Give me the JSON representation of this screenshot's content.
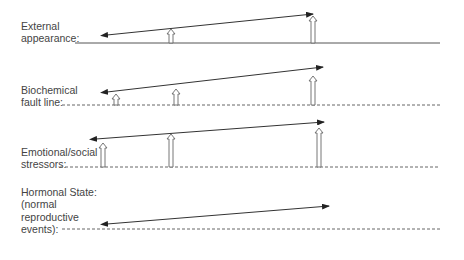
{
  "diagram": {
    "rows": [
      {
        "label_lines": [
          "External",
          "appearance:"
        ],
        "baseline": {
          "style": "solid",
          "y": 43,
          "x1": 75,
          "x2": 440
        },
        "double_arrow": {
          "x1": 107,
          "y1": 35,
          "x2": 313,
          "y2": 14
        },
        "up_arrows": [
          {
            "x": 171,
            "top": 29
          },
          {
            "x": 313,
            "top": 16
          }
        ]
      },
      {
        "label_lines": [
          "Biochemical",
          "fault line:"
        ],
        "baseline": {
          "style": "dashed",
          "y": 105,
          "x1": 62,
          "x2": 440
        },
        "double_arrow": {
          "x1": 107,
          "y1": 92,
          "x2": 323,
          "y2": 67
        },
        "up_arrows": [
          {
            "x": 116,
            "top": 94
          },
          {
            "x": 176,
            "top": 89
          },
          {
            "x": 313,
            "top": 76
          }
        ]
      },
      {
        "label_lines": [
          "Emotional/social",
          "stressors:"
        ],
        "baseline": {
          "style": "dashed",
          "y": 167,
          "x1": 60,
          "x2": 440
        },
        "double_arrow": {
          "x1": 96,
          "y1": 139,
          "x2": 324,
          "y2": 122
        },
        "up_arrows": [
          {
            "x": 103,
            "top": 143
          },
          {
            "x": 171,
            "top": 134
          },
          {
            "x": 319,
            "top": 128
          }
        ]
      },
      {
        "label_lines": [
          "Hormonal State:",
          "(normal",
          "reproductive",
          "events):"
        ],
        "baseline": {
          "style": "dashed",
          "y": 229,
          "x1": 62,
          "x2": 440
        },
        "double_arrow": {
          "x1": 107,
          "y1": 224,
          "x2": 329,
          "y2": 206
        },
        "up_arrows": []
      }
    ],
    "colors": {
      "line": "#555555",
      "text": "#444444",
      "arrow_outline": "#666666"
    }
  }
}
